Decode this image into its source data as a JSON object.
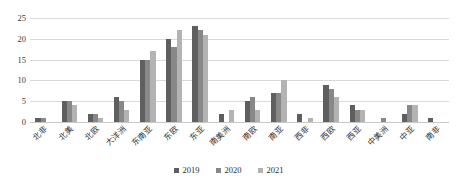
{
  "chart_data": {
    "type": "bar",
    "title": "",
    "subtitle": "",
    "xlabel": "",
    "ylabel": "",
    "ylim": [
      0,
      25
    ],
    "yticks": [
      0,
      5,
      10,
      15,
      20,
      25
    ],
    "grid": true,
    "legend_position": "bottom-center",
    "categories": [
      "北非",
      "北美",
      "北欧",
      "大洋洲",
      "东南亚",
      "东欧",
      "东亚",
      "南美洲",
      "南欧",
      "南亚",
      "西非",
      "西欧",
      "西亚",
      "中美洲",
      "中亚",
      "南非"
    ],
    "series": [
      {
        "name": "2019",
        "color": "#5f5f5f",
        "values": [
          1,
          5,
          2,
          6,
          15,
          20,
          23,
          2,
          5,
          7,
          2,
          9,
          4,
          0,
          2,
          1
        ]
      },
      {
        "name": "2020",
        "color": "#888888",
        "values": [
          1,
          5,
          2,
          5,
          15,
          18,
          22,
          0,
          6,
          7,
          0,
          8,
          3,
          1,
          4,
          0
        ]
      },
      {
        "name": "2021",
        "color": "#b3b3b3",
        "values": [
          0,
          4,
          1,
          3,
          17,
          22,
          21,
          3,
          3,
          10,
          1,
          6,
          3,
          0,
          4,
          0
        ]
      }
    ]
  },
  "legend": {
    "items": [
      {
        "label": "2019"
      },
      {
        "label": "2020"
      },
      {
        "label": "2021"
      }
    ]
  },
  "axis": {
    "y_tick_labels": [
      "25",
      "20",
      "15",
      "10",
      "5",
      "0"
    ]
  }
}
